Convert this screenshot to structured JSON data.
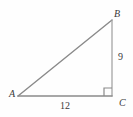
{
  "figure": {
    "type": "right-triangle-diagram",
    "background_color": "#fefefe",
    "stroke_color": "#8a8a8a",
    "text_color": "#3a3a3a",
    "vertices": {
      "A": {
        "label": "A",
        "x": 18,
        "y": 96
      },
      "B": {
        "label": "B",
        "x": 112,
        "y": 20
      },
      "C": {
        "label": "C",
        "x": 112,
        "y": 96
      }
    },
    "sides": {
      "bc": {
        "label": "9",
        "name": "vertical-leg"
      },
      "ac": {
        "label": "12",
        "name": "horizontal-leg"
      },
      "ab": {
        "label": "",
        "name": "hypotenuse"
      }
    },
    "right_angle_at": "C",
    "right_angle_marker_size": 8
  }
}
